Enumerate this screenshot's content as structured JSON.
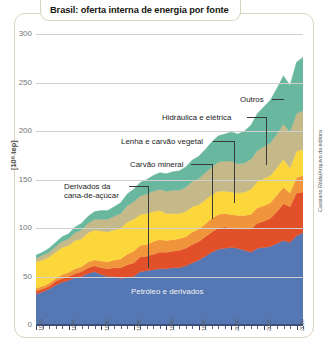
{
  "header": {
    "title": "Brasil: oferta interna de energia por fonte"
  },
  "credit": "Cassiano Róda/Arquivo da editora",
  "chart_data": {
    "type": "area",
    "title": "Brasil: oferta interna de energia por fonte",
    "xlabel": "",
    "ylabel": "[10⁶ tep]",
    "ylim": [
      0,
      300
    ],
    "xlim": [
      1970,
      2011
    ],
    "grid": true,
    "legend_position": "inline-callouts",
    "ytick_labels": [
      "300",
      "250",
      "200",
      "150",
      "100",
      "50",
      "0"
    ],
    "ytick_values": [
      300,
      250,
      200,
      150,
      100,
      50,
      0
    ],
    "xtick_labels": [
      "1970",
      "1975",
      "1980",
      "1985",
      "1990",
      "1995",
      "2000",
      "2005",
      "2010"
    ],
    "xtick_values": [
      1970,
      1975,
      1980,
      1985,
      1990,
      1995,
      2000,
      2005,
      2010
    ],
    "x": [
      1970,
      1971,
      1972,
      1973,
      1974,
      1975,
      1976,
      1977,
      1978,
      1979,
      1980,
      1981,
      1982,
      1983,
      1984,
      1985,
      1986,
      1987,
      1988,
      1989,
      1990,
      1991,
      1992,
      1993,
      1994,
      1995,
      1996,
      1997,
      1998,
      1999,
      2000,
      2001,
      2002,
      2003,
      2004,
      2005,
      2006,
      2007,
      2008,
      2009,
      2010,
      2011
    ],
    "series": [
      {
        "name": "Petróleo e derivados",
        "color": "#5578b4",
        "values": [
          32,
          34,
          37,
          41,
          44,
          46,
          49,
          50,
          53,
          55,
          52,
          50,
          50,
          48,
          49,
          50,
          55,
          56,
          57,
          58,
          58,
          59,
          59,
          61,
          64,
          67,
          71,
          75,
          78,
          79,
          80,
          79,
          77,
          75,
          79,
          80,
          81,
          84,
          87,
          85,
          92,
          95
        ]
      },
      {
        "name": "Derivados da cana-de-açúcar",
        "color": "#e2502a",
        "values": [
          3,
          3,
          3,
          4,
          4,
          4,
          4,
          5,
          6,
          6,
          7,
          8,
          9,
          11,
          13,
          14,
          15,
          15,
          16,
          17,
          17,
          17,
          18,
          18,
          19,
          19,
          20,
          21,
          22,
          22,
          20,
          20,
          22,
          24,
          26,
          27,
          29,
          33,
          38,
          37,
          44,
          42
        ]
      },
      {
        "name": "Carvão mineral",
        "color": "#f0953c",
        "values": [
          3,
          3,
          3,
          3,
          4,
          4,
          5,
          5,
          6,
          6,
          7,
          7,
          8,
          9,
          11,
          12,
          12,
          12,
          13,
          13,
          12,
          12,
          12,
          12,
          13,
          13,
          13,
          14,
          14,
          14,
          14,
          14,
          14,
          15,
          16,
          16,
          16,
          17,
          17,
          14,
          16,
          17
        ]
      },
      {
        "name": "Lenha e carvão vegetal",
        "color": "#fbd73b",
        "values": [
          27,
          27,
          27,
          27,
          28,
          28,
          29,
          29,
          30,
          31,
          31,
          31,
          31,
          32,
          33,
          33,
          32,
          32,
          31,
          30,
          28,
          27,
          26,
          26,
          26,
          25,
          25,
          24,
          24,
          23,
          23,
          23,
          24,
          26,
          27,
          28,
          28,
          28,
          29,
          26,
          27,
          27
        ]
      },
      {
        "name": "Hidráulica e elétrica",
        "color": "#c5b98a",
        "values": [
          4,
          5,
          5,
          6,
          6,
          7,
          8,
          9,
          10,
          11,
          12,
          13,
          14,
          15,
          17,
          18,
          19,
          20,
          21,
          22,
          23,
          24,
          24,
          25,
          26,
          27,
          28,
          29,
          30,
          31,
          32,
          30,
          30,
          31,
          32,
          33,
          34,
          35,
          36,
          37,
          39,
          40
        ]
      },
      {
        "name": "Outros",
        "color": "#68b79e",
        "values": [
          3,
          3,
          4,
          4,
          5,
          5,
          6,
          7,
          7,
          8,
          9,
          9,
          10,
          11,
          12,
          13,
          14,
          15,
          16,
          17,
          18,
          19,
          20,
          21,
          22,
          23,
          24,
          26,
          27,
          28,
          30,
          31,
          33,
          35,
          38,
          41,
          44,
          47,
          50,
          48,
          53,
          55
        ]
      }
    ],
    "annotations": [
      {
        "label": "Outros",
        "target_series": "Outros"
      },
      {
        "label": "Hidráulica e elétrica",
        "target_series": "Hidráulica e elétrica"
      },
      {
        "label": "Lenha e carvão vegetal",
        "target_series": "Lenha e carvão vegetal"
      },
      {
        "label": "Carvão mineral",
        "target_series": "Carvão mineral"
      },
      {
        "label": "Derivados da cana-de-açúcar",
        "target_series": "Derivados da cana-de-açúcar"
      },
      {
        "label": "Petróleo e derivados",
        "target_series": "Petróleo e derivados"
      }
    ],
    "callout_lines": [
      {
        "label_line_1": "Derivados da",
        "label_line_2": "cana-de-açúcar"
      }
    ]
  }
}
